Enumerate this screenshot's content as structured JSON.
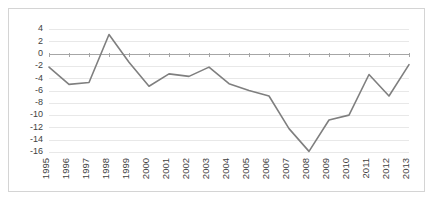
{
  "chart_data": {
    "type": "line",
    "title": "",
    "subtitle": "",
    "xlabel": "",
    "ylabel": "",
    "categories": [
      "1995",
      "1996",
      "1997",
      "1998",
      "1999",
      "2000",
      "2001",
      "2002",
      "2003",
      "2004",
      "2005",
      "2006",
      "2007",
      "2008",
      "2009",
      "2010",
      "2011",
      "2012",
      "2013"
    ],
    "values": [
      -2.2,
      -5.0,
      -4.7,
      3.1,
      -1.4,
      -5.3,
      -3.3,
      -3.7,
      -2.2,
      -4.9,
      -6.0,
      -6.9,
      -12.2,
      -15.9,
      -10.8,
      -10.0,
      -3.4,
      -6.9,
      -1.8
    ],
    "series": [
      {
        "name": "series-1",
        "values": [
          -2.2,
          -5.0,
          -4.7,
          3.1,
          -1.4,
          -5.3,
          -3.3,
          -3.7,
          -2.2,
          -4.9,
          -6.0,
          -6.9,
          -12.2,
          -15.9,
          -10.8,
          -10.0,
          -3.4,
          -6.9,
          -1.8
        ],
        "color": "#7f7f7f"
      }
    ],
    "ylim": [
      -16,
      4
    ],
    "yticks": [
      4,
      2,
      0,
      -2,
      -4,
      -6,
      -8,
      -10,
      -12,
      -14,
      -16
    ],
    "ytick_labels": [
      "4",
      "2",
      "0",
      "-2",
      "-4",
      "-6",
      "-8",
      "-10",
      "-12",
      "-14",
      "-16"
    ],
    "grid": true,
    "grid_color": "#e8e8e8",
    "zero_line_color": "#a6a6a6",
    "legend": "none",
    "xtick_rotation": 90,
    "border_color": "#d4d4d4",
    "background": "#ffffff"
  },
  "chart": {
    "plot_left": 40,
    "plot_right": 400,
    "plot_top": 20,
    "plot_bottom": 143
  }
}
